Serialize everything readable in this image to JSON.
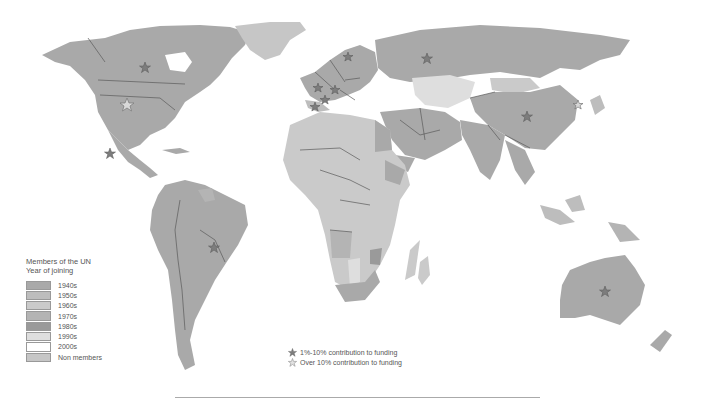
{
  "map": {
    "title": "UN membership world map",
    "colors": {
      "1940s": "#a9a9a9",
      "1950s": "#bdbdbd",
      "1960s": "#cacaca",
      "1970s": "#b4b4b4",
      "1980s": "#9a9a9a",
      "1990s": "#dedede",
      "2000s": "#ffffff",
      "Non members": "#c6c6c6"
    }
  },
  "legend": {
    "title_line1": "Members of the UN",
    "title_line2": "Year of joining",
    "items": [
      {
        "label": "1940s",
        "color": "#a9a9a9"
      },
      {
        "label": "1950s",
        "color": "#bdbdbd"
      },
      {
        "label": "1960s",
        "color": "#cacaca"
      },
      {
        "label": "1970s",
        "color": "#b4b4b4"
      },
      {
        "label": "1980s",
        "color": "#9a9a9a"
      },
      {
        "label": "1990s",
        "color": "#dedede"
      },
      {
        "label": "2000s",
        "color": "#ffffff"
      },
      {
        "label": "Non members",
        "color": "#c6c6c6"
      }
    ]
  },
  "funding_legend": {
    "items": [
      {
        "icon": "star-filled-icon",
        "label": "1%-10% contribution to funding"
      },
      {
        "icon": "star-outline-icon",
        "label": "Over 10% contribution to funding"
      }
    ]
  },
  "markers": [
    {
      "country": "Canada",
      "type": "1-10"
    },
    {
      "country": "United States",
      "type": "over-10"
    },
    {
      "country": "Mexico",
      "type": "1-10"
    },
    {
      "country": "Brazil",
      "type": "1-10"
    },
    {
      "country": "United Kingdom",
      "type": "1-10"
    },
    {
      "country": "France",
      "type": "1-10"
    },
    {
      "country": "Germany",
      "type": "1-10"
    },
    {
      "country": "Spain",
      "type": "1-10"
    },
    {
      "country": "Italy",
      "type": "1-10"
    },
    {
      "country": "Netherlands",
      "type": "1-10"
    },
    {
      "country": "Sweden",
      "type": "1-10"
    },
    {
      "country": "Russia",
      "type": "1-10"
    },
    {
      "country": "China",
      "type": "1-10"
    },
    {
      "country": "South Korea",
      "type": "1-10"
    },
    {
      "country": "Japan",
      "type": "over-10"
    },
    {
      "country": "Australia",
      "type": "1-10"
    }
  ]
}
